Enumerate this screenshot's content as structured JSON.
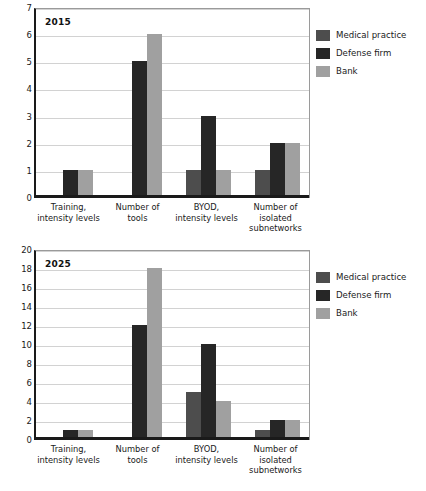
{
  "series_colors": {
    "medical_practice": "#4d4d4d",
    "defense_firm": "#262626",
    "bank": "#a0a0a0"
  },
  "legend": {
    "items": [
      {
        "label": "Medical practice",
        "color": "#4d4d4d",
        "key": "medical-practice"
      },
      {
        "label": "Defense firm",
        "color": "#262626",
        "key": "defense-firm"
      },
      {
        "label": "Bank",
        "color": "#a0a0a0",
        "key": "bank"
      }
    ]
  },
  "categories": [
    "Training,\nintensity levels",
    "Number of\ntools",
    "BYOD,\nintensity levels",
    "Number of\nisolated\nsubnetworks"
  ],
  "chart_data": [
    {
      "type": "bar",
      "title": "2015",
      "xlabel": "",
      "ylabel": "",
      "ylim": [
        0,
        7
      ],
      "ytick_step": 1,
      "yticks": [
        0,
        1,
        2,
        3,
        4,
        5,
        6,
        7
      ],
      "grid": true,
      "legend_position": "right",
      "categories": [
        "Training, intensity levels",
        "Number of tools",
        "BYOD, intensity levels",
        "Number of isolated subnetworks"
      ],
      "series": [
        {
          "name": "Medical practice",
          "color": "#4d4d4d",
          "values": [
            0,
            0,
            1,
            1
          ]
        },
        {
          "name": "Defense firm",
          "color": "#262626",
          "values": [
            1,
            5,
            3,
            2
          ]
        },
        {
          "name": "Bank",
          "color": "#a0a0a0",
          "values": [
            1,
            6,
            1,
            2
          ]
        }
      ]
    },
    {
      "type": "bar",
      "title": "2025",
      "xlabel": "",
      "ylabel": "",
      "ylim": [
        0,
        20
      ],
      "ytick_step": 2,
      "yticks": [
        0,
        2,
        4,
        6,
        8,
        10,
        12,
        14,
        16,
        18,
        20
      ],
      "grid": true,
      "legend_position": "right",
      "categories": [
        "Training, intensity levels",
        "Number of tools",
        "BYOD, intensity levels",
        "Number of isolated subnetworks"
      ],
      "series": [
        {
          "name": "Medical practice",
          "color": "#4d4d4d",
          "values": [
            0,
            0,
            5,
            1
          ]
        },
        {
          "name": "Defense firm",
          "color": "#262626",
          "values": [
            1,
            12,
            10,
            2
          ]
        },
        {
          "name": "Bank",
          "color": "#a0a0a0",
          "values": [
            1,
            18,
            4,
            2
          ]
        }
      ]
    }
  ]
}
